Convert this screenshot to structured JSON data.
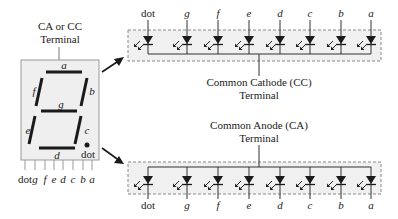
{
  "display": {
    "terminal_label_line1": "CA or CC",
    "terminal_label_line2": "Terminal",
    "segments": {
      "a": "a",
      "b": "b",
      "c": "c",
      "d": "d",
      "e": "e",
      "f": "f",
      "g": "g",
      "dot": "dot"
    },
    "pins": [
      "dot",
      "g",
      "f",
      "e",
      "d",
      "c",
      "b",
      "a"
    ]
  },
  "common_cathode": {
    "label_line1": "Common Cathode (CC)",
    "label_line2": "Terminal",
    "diode_labels": [
      "dot",
      "g",
      "f",
      "e",
      "d",
      "c",
      "b",
      "a"
    ]
  },
  "common_anode": {
    "label_line1": "Common Anode (CA)",
    "label_line2": "Terminal",
    "diode_labels": [
      "dot",
      "g",
      "f",
      "e",
      "d",
      "c",
      "b",
      "a"
    ]
  },
  "colors": {
    "segment": "#1a1a1a",
    "panel_fill": "#efefef",
    "panel_border": "#999999",
    "box_fill": "#f0f0f0",
    "wire": "#333333"
  }
}
